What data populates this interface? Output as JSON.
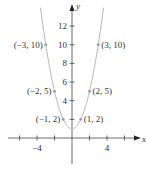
{
  "chart_data": {
    "type": "line",
    "title": "",
    "equation": "y = x^2 + 1",
    "xlabel": "x",
    "ylabel": "y",
    "xlim": [
      -8,
      8.5
    ],
    "ylim": [
      -3.5,
      14.5
    ],
    "x_ticks": [
      -6,
      -4,
      -2,
      2,
      4,
      6
    ],
    "x_tick_labels": [
      {
        "value": -4,
        "label": "−4"
      },
      {
        "value": 4,
        "label": "4"
      }
    ],
    "y_ticks": [
      2,
      4,
      6,
      8,
      10,
      12
    ],
    "y_tick_labels": [
      {
        "value": 4,
        "label": "4"
      },
      {
        "value": 6,
        "label": "6"
      },
      {
        "value": 8,
        "label": "8"
      },
      {
        "value": 10,
        "label": "10"
      },
      {
        "value": 12,
        "label": "12"
      }
    ],
    "grid": false,
    "curve_color": "#b8b8b8",
    "series": [
      {
        "name": "parabola",
        "x": [
          -3.6,
          -3,
          -2,
          -1,
          0,
          1,
          2,
          3,
          3.6
        ],
        "y": [
          13.96,
          10,
          5,
          2,
          1,
          2,
          5,
          10,
          13.96
        ]
      }
    ],
    "points": [
      {
        "x": -3,
        "y": 10,
        "label": "(−3, 10)"
      },
      {
        "x": 3,
        "y": 10,
        "label": "(3, 10)"
      },
      {
        "x": -2,
        "y": 5,
        "label": "(−2, 5)"
      },
      {
        "x": 2,
        "y": 5,
        "label": "(2, 5)"
      },
      {
        "x": -1,
        "y": 2,
        "label": "(−1, 2)"
      },
      {
        "x": 1,
        "y": 2,
        "label": "(1, 2)"
      }
    ]
  }
}
